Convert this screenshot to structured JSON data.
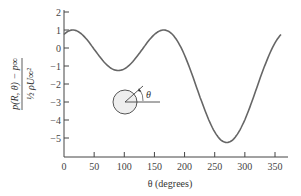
{
  "chart_data": {
    "type": "line",
    "title": "",
    "xlabel": "θ (degrees)",
    "ylabel": "(p(R, θ) − p∞) / (½ ρ U∞²)",
    "ylabel_numerator": "p(R, θ) − p∞",
    "ylabel_denominator": "½ ρU∞²",
    "xlim": [
      0,
      365
    ],
    "ylim": [
      -6,
      2
    ],
    "xticks": [
      0,
      50,
      100,
      150,
      200,
      250,
      300,
      350
    ],
    "yticks": [
      2,
      1,
      0,
      -1,
      -2,
      -3,
      -4,
      -5
    ],
    "grid": false,
    "series": [
      {
        "name": "Pressure coefficient",
        "formula": "1 - (2 sin θ - 0.5)^2",
        "x": [
          0,
          15,
          30,
          45,
          60,
          75,
          90,
          105,
          120,
          135,
          150,
          165,
          180,
          195,
          210,
          225,
          240,
          255,
          270,
          285,
          300,
          315,
          330,
          345,
          360
        ],
        "values": [
          0.75,
          0.98,
          1.0,
          0.5,
          -0.27,
          -0.96,
          -1.25,
          -0.96,
          -0.27,
          0.5,
          1.0,
          0.98,
          0.75,
          0.08,
          -1.0,
          -2.36,
          -3.73,
          -4.83,
          -5.25,
          -4.83,
          -3.73,
          -2.36,
          -1.0,
          0.08,
          0.75
        ]
      }
    ],
    "annotations": [
      {
        "type": "inset-diagram",
        "label": "θ",
        "description": "cylinder with angle θ measured from horizontal axis"
      }
    ]
  }
}
